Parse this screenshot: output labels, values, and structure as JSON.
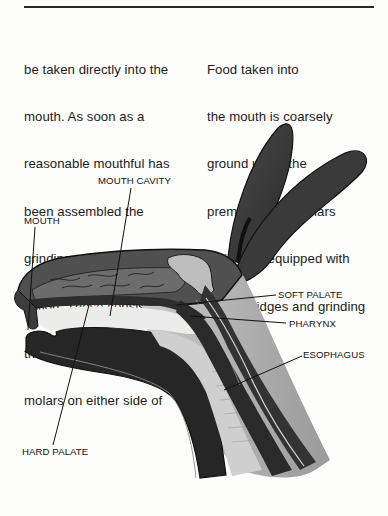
{
  "page": {
    "rule": true,
    "columns": {
      "left": [
        "be taken directly into the",
        "mouth. As soon as a",
        "reasonable mouthful has",
        "been assembled the",
        "grinding teeth come into",
        "action. These consist of",
        "three premolars and three",
        "molars on either side of"
      ],
      "right": [
        "Food taken into",
        "the mouth is coarsely",
        "ground up by the",
        "premolars and molars",
        "which are equipped with",
        "special ridges and grinding"
      ]
    }
  },
  "figure": {
    "labels": {
      "mouth_cavity": "MOUTH CAVITY",
      "mouth": "MOUTH",
      "soft_palate": "SOFT PALATE",
      "pharynx": "PHARYNX",
      "esophagus": "ESOPHAGUS",
      "hard_palate": "HARD PALATE"
    },
    "colors": {
      "ink": "#1b1b1b",
      "dark_tissue": "#2b2b2b",
      "mid_tissue": "#5a5a5a",
      "light_tissue": "#bdbdbd",
      "cavity": "#e9e9e6",
      "paper": "#fdfdfb"
    }
  }
}
